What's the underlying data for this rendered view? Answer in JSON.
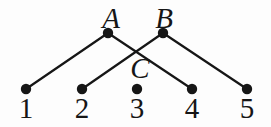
{
  "figure": {
    "colors": {
      "background": "#fdfdfd",
      "ink": "#161616"
    },
    "dot_radius": 5.2,
    "line_width": 2.2,
    "font_size": 29,
    "nodes": [
      {
        "id": "A",
        "label": "A",
        "x": 108,
        "y": 33,
        "label_x": 111,
        "label_y": 28,
        "label_style": "letter"
      },
      {
        "id": "B",
        "label": "B",
        "x": 163,
        "y": 33,
        "label_x": 164,
        "label_y": 28,
        "label_style": "letter"
      },
      {
        "id": "1",
        "label": "1",
        "x": 26,
        "y": 89,
        "label_x": 26,
        "label_y": 118,
        "label_style": "digit"
      },
      {
        "id": "2",
        "label": "2",
        "x": 82,
        "y": 89,
        "label_x": 82,
        "label_y": 118,
        "label_style": "digit"
      },
      {
        "id": "3",
        "label": "3",
        "x": 137,
        "y": 89,
        "label_x": 137,
        "label_y": 118,
        "label_style": "digit"
      },
      {
        "id": "4",
        "label": "4",
        "x": 192,
        "y": 89,
        "label_x": 192,
        "label_y": 118,
        "label_style": "digit"
      },
      {
        "id": "5",
        "label": "5",
        "x": 247,
        "y": 89,
        "label_x": 247,
        "label_y": 118,
        "label_style": "digit"
      }
    ],
    "standalone_labels": [
      {
        "text": "C",
        "x": 140,
        "y": 78,
        "label_style": "letter"
      }
    ],
    "edges": [
      {
        "from": "A",
        "to": "1"
      },
      {
        "from": "A",
        "to": "4"
      },
      {
        "from": "B",
        "to": "2"
      },
      {
        "from": "B",
        "to": "5"
      }
    ]
  }
}
